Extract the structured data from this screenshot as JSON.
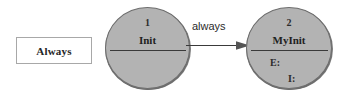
{
  "diagram": {
    "type": "state-transition-diagram",
    "legend": {
      "label": "Always"
    },
    "states": [
      {
        "number": "1",
        "name": "Init",
        "attributes": []
      },
      {
        "number": "2",
        "name": "MyInit",
        "attributes": [
          {
            "key": "E:",
            "value": ""
          },
          {
            "key": "I:",
            "value": ""
          }
        ]
      }
    ],
    "transitions": [
      {
        "label": "always",
        "from": "1",
        "to": "2",
        "arrowhead": "filled-triangle"
      }
    ],
    "colors": {
      "state_fill": "#b3b3b3",
      "state_stroke": "#6e6e6e",
      "legend_fill": "#ffffff",
      "legend_stroke": "#a8a8a8",
      "text": "#1f1f1f",
      "arrow": "#3a3a3a",
      "background": "#ffffff"
    }
  }
}
